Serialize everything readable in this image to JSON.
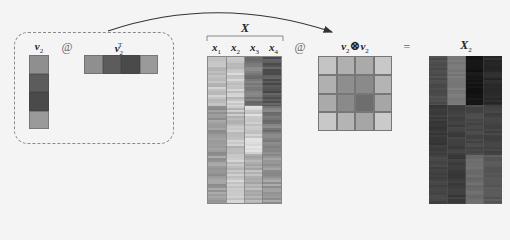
{
  "labels": {
    "v2": "v",
    "v2_sub": "2",
    "v2T": "v",
    "v2T_sub": "2",
    "v2T_sup": "T",
    "X": "X",
    "x_cols": [
      {
        "name": "x",
        "sub": "1"
      },
      {
        "name": "x",
        "sub": "2"
      },
      {
        "name": "x",
        "sub": "3"
      },
      {
        "name": "x",
        "sub": "4"
      }
    ],
    "outer_left": "v",
    "outer_left_sub": "2",
    "outer_op": "⊗",
    "outer_right": "v",
    "outer_right_sub": "2",
    "X2": "X",
    "X2_sub": "2"
  },
  "operators": {
    "matmul_1": "@",
    "matmul_2": "@",
    "equals": "="
  },
  "colors": {
    "v2": [
      "#8f8f8f",
      "#5c5c5c",
      "#4a4a4a",
      "#9a9a9a"
    ],
    "v2T": [
      "#8f8f8f",
      "#5c5c5c",
      "#4a4a4a",
      "#9a9a9a"
    ],
    "outer": [
      [
        "#c4c4c4",
        "#b0b0b0",
        "#aaaaaa",
        "#c8c8c8"
      ],
      [
        "#b0b0b0",
        "#8e8e8e",
        "#8a8a8a",
        "#b4b4b4"
      ],
      [
        "#aaaaaa",
        "#8a8a8a",
        "#6e6e6e",
        "#a6a6a6"
      ],
      [
        "#c8c8c8",
        "#b4b4b4",
        "#a6a6a6",
        "#cacaca"
      ]
    ],
    "X_bands": [
      [
        "#c2c2c2",
        "#c8c8c8",
        "#7a7a7a",
        "#555555"
      ],
      [
        "#9c9c9c",
        "#c0c0c0",
        "#d2d2d2",
        "#7c7c7c"
      ],
      [
        "#9a9a9a",
        "#c6c6c6",
        "#b4b4b4",
        "#9a9a9a"
      ]
    ],
    "X2_bands": [
      [
        "#4e4e4e",
        "#7a7a7a",
        "#161616",
        "#2a2a2a"
      ],
      [
        "#3a3a3a",
        "#404040",
        "#484848",
        "#444444"
      ],
      [
        "#444444",
        "#3c3c3c",
        "#6c6c6c",
        "#585858"
      ]
    ]
  }
}
